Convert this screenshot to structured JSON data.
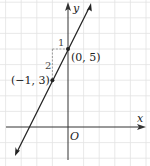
{
  "figure": {
    "type": "coordinate-graph",
    "axes": {
      "x_label": "x",
      "y_label": "y",
      "origin_label": "O"
    },
    "line": {
      "equation": "y = 2x + 5",
      "slope": 2,
      "y_intercept": 5
    },
    "points": [
      {
        "label": "(−1, 3)",
        "x": -1,
        "y": 3
      },
      {
        "label": "(0, 5)",
        "x": 0,
        "y": 5
      }
    ],
    "slope_triangle": {
      "run_label": "1",
      "rise_label": "2"
    },
    "colors": {
      "line": "#222222",
      "axis": "#333333",
      "grid": "#dddddd",
      "dashed": "#888888"
    }
  }
}
